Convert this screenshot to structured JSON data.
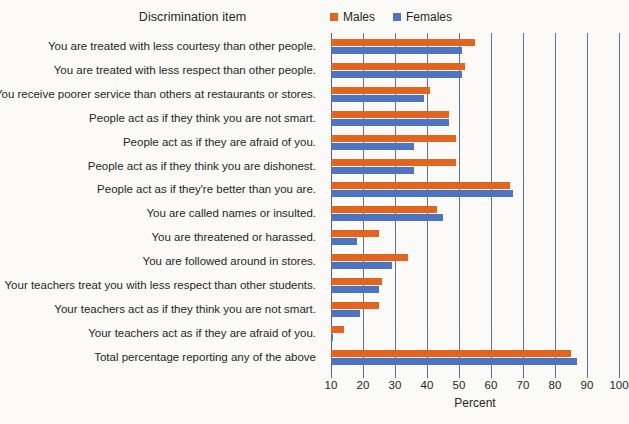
{
  "chart_data": {
    "type": "bar",
    "orientation": "horizontal",
    "title": "Discrimination item",
    "xlabel": "Percent",
    "ylabel": "",
    "xlim": [
      10,
      100
    ],
    "xticks": [
      10,
      20,
      30,
      40,
      50,
      60,
      70,
      80,
      90,
      100
    ],
    "grid": true,
    "legend_position": "top-right",
    "categories": [
      "You are treated with less courtesy than other people.",
      "You are treated with less respect than other people.",
      "You receive poorer service than others at restaurants or stores.",
      "People act as if they think you are not smart.",
      "People act as if they are afraid of you.",
      "People act as if they think you are dishonest.",
      "People act as if they're better than you are.",
      "You are called names or insulted.",
      "You are threatened or harassed.",
      "You are followed around in stores.",
      "Your teachers treat you with less respect than other students.",
      "Your teachers act as if they think you are not smart.",
      "Your teachers act as if they are afraid of you.",
      "Total percentage reporting any of the above"
    ],
    "series": [
      {
        "name": "Males",
        "color": "#e2641e",
        "values": [
          55,
          52,
          41,
          47,
          49,
          49,
          66,
          43,
          25,
          34,
          26,
          25,
          14,
          85
        ]
      },
      {
        "name": "Females",
        "color": "#4f73c3",
        "values": [
          51,
          51,
          39,
          47,
          36,
          36,
          67,
          45,
          18,
          29,
          25,
          19,
          10.5,
          87
        ]
      }
    ]
  },
  "colors": {
    "males": "#e2641e",
    "females": "#4f73c3",
    "gridline": "#5d6fa8",
    "background": "#fbfaf7",
    "text": "#262626"
  },
  "legend": {
    "items": [
      {
        "label": "Males",
        "color": "#e2641e"
      },
      {
        "label": "Females",
        "color": "#4f73c3"
      }
    ]
  },
  "axis": {
    "title": "Percent",
    "ticks": [
      "10",
      "20",
      "30",
      "40",
      "50",
      "60",
      "70",
      "80",
      "90",
      "100"
    ]
  }
}
